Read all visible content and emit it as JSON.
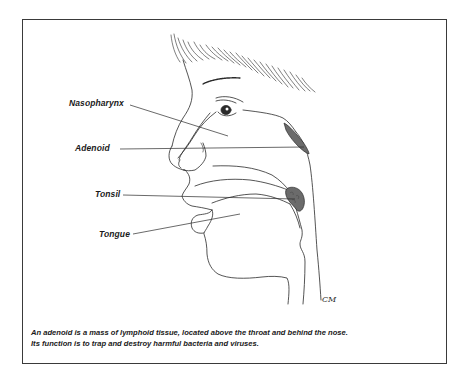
{
  "diagram": {
    "type": "anatomical-illustration",
    "labels": [
      {
        "id": "nasopharynx",
        "text": "Nasopharynx"
      },
      {
        "id": "adenoid",
        "text": "Adenoid"
      },
      {
        "id": "tonsil",
        "text": "Tonsil"
      },
      {
        "id": "tongue",
        "text": "Tongue"
      }
    ],
    "caption": {
      "line1": "An adenoid is a mass of lymphoid tissue, located above the throat and behind the nose.",
      "line2": "Its function is to trap and destroy harmful bacteria and viruses."
    },
    "signature": "CM",
    "colors": {
      "line": "#2a2a2a",
      "tissue_fill": "#6b6b6b",
      "frame": "#3a3a3a",
      "background": "#ffffff"
    }
  }
}
